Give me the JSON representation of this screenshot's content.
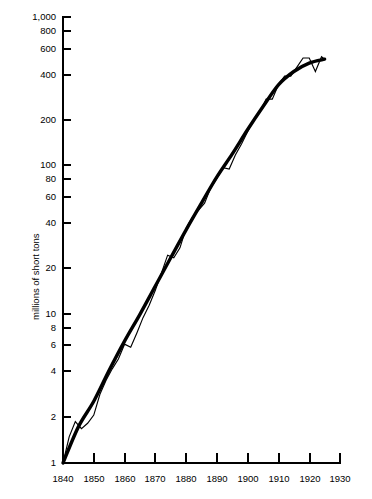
{
  "chart_data": {
    "type": "line",
    "title": "",
    "xlabel": "",
    "ylabel": "millions of short tons",
    "yscale": "log",
    "ylim": [
      1,
      1000
    ],
    "xlim": [
      1840,
      1930
    ],
    "grid": false,
    "legend": "none",
    "ytick_labels": [
      "1,000",
      "800",
      "600",
      "400",
      "200",
      "100",
      "80",
      "60",
      "40",
      "20",
      "10",
      "8",
      "6",
      "4",
      "2",
      "1"
    ],
    "ytick_values": [
      1000,
      800,
      600,
      400,
      200,
      100,
      80,
      60,
      40,
      20,
      10,
      8,
      6,
      4,
      2,
      1
    ],
    "xtick_labels": [
      "1840",
      "1850",
      "1860",
      "1870",
      "1880",
      "1890",
      "1900",
      "1910",
      "1920",
      "1930"
    ],
    "xtick_values": [
      1840,
      1850,
      1860,
      1870,
      1880,
      1890,
      1900,
      1910,
      1920,
      1930
    ],
    "series": [
      {
        "name": "trend",
        "style": "thick-smooth",
        "x": [
          1840,
          1845,
          1850,
          1855,
          1860,
          1865,
          1870,
          1875,
          1880,
          1885,
          1890,
          1895,
          1900,
          1905,
          1910,
          1915,
          1920,
          1925
        ],
        "values": [
          1.0,
          1.75,
          2.6,
          4.2,
          6.6,
          10.0,
          15.5,
          24.0,
          37.0,
          56.0,
          84.0,
          120.0,
          175.0,
          250.0,
          350.0,
          430.0,
          490.0,
          520.0
        ]
      },
      {
        "name": "actual",
        "style": "thin-jagged",
        "x": [
          1840,
          1842,
          1844,
          1846,
          1848,
          1850,
          1852,
          1854,
          1856,
          1858,
          1860,
          1862,
          1864,
          1866,
          1868,
          1870,
          1872,
          1874,
          1876,
          1878,
          1880,
          1882,
          1884,
          1886,
          1888,
          1890,
          1892,
          1894,
          1896,
          1898,
          1900,
          1902,
          1904,
          1906,
          1908,
          1910,
          1912,
          1914,
          1916,
          1918,
          1920,
          1922,
          1924,
          1925
        ],
        "values": [
          1.0,
          1.5,
          1.9,
          1.7,
          1.85,
          2.1,
          2.9,
          3.6,
          4.3,
          5.0,
          6.3,
          6.0,
          7.5,
          9.5,
          11.5,
          14.5,
          19.0,
          25.0,
          24.0,
          28.0,
          38.0,
          45.0,
          50.0,
          56.0,
          71.0,
          82.0,
          97.0,
          95.0,
          118.0,
          140.0,
          170.0,
          205.0,
          230.0,
          280.0,
          280.0,
          350.0,
          400.0,
          400.0,
          460.0,
          530.0,
          530.0,
          430.0,
          540.0,
          520.0
        ]
      }
    ],
    "annotations": []
  }
}
